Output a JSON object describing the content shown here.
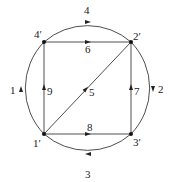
{
  "diagram": {
    "type": "directed-graph",
    "nodes": [
      {
        "id": "1p",
        "label": "1′"
      },
      {
        "id": "2p",
        "label": "2′"
      },
      {
        "id": "3p",
        "label": "3′"
      },
      {
        "id": "4p",
        "label": "4′"
      }
    ],
    "edges": [
      {
        "id": "e1",
        "label": "1",
        "from": "1p",
        "to": "4p",
        "kind": "arc"
      },
      {
        "id": "e2",
        "label": "2",
        "from": "2p",
        "to": "3p",
        "kind": "arc"
      },
      {
        "id": "e3",
        "label": "3",
        "from": "3p",
        "to": "1p",
        "kind": "arc"
      },
      {
        "id": "e4",
        "label": "4",
        "from": "4p",
        "to": "2p",
        "kind": "arc"
      },
      {
        "id": "e5",
        "label": "5",
        "from": "1p",
        "to": "2p",
        "kind": "line"
      },
      {
        "id": "e6",
        "label": "6",
        "from": "4p",
        "to": "2p",
        "kind": "line"
      },
      {
        "id": "e7",
        "label": "7",
        "from": "3p",
        "to": "2p",
        "kind": "line"
      },
      {
        "id": "e8",
        "label": "8",
        "from": "1p",
        "to": "3p",
        "kind": "line"
      },
      {
        "id": "e9",
        "label": "9",
        "from": "1p",
        "to": "4p",
        "kind": "line"
      }
    ],
    "colors": {
      "stroke": "#3a3a3a",
      "node": "#111111",
      "text": "#222222"
    }
  }
}
